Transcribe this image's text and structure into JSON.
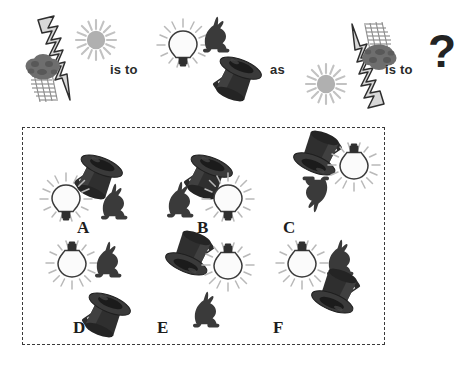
{
  "puzzle": {
    "type": "visual-analogy",
    "connectors": {
      "first": "is to",
      "second": "as",
      "third": "is to"
    },
    "unknown_marker": "?",
    "prompt_row": {
      "term_a": {
        "name": "storm-scene",
        "elements": [
          "storm-cloud-with-rain",
          "lightning-bolt",
          "sun-starburst"
        ],
        "orientation": "upright"
      },
      "term_b": {
        "name": "magic-scene",
        "elements": [
          "light-bulb",
          "rabbit",
          "top-hat-with-wand"
        ],
        "orientation": "upright"
      },
      "term_c": {
        "name": "storm-scene-rotated",
        "elements": [
          "storm-cloud-with-rain",
          "lightning-bolt",
          "sun-starburst"
        ],
        "orientation": "rotated-180"
      },
      "term_d": {
        "name": "unknown",
        "elements": [],
        "orientation": "unknown"
      }
    },
    "options": [
      {
        "label": "A",
        "bulb": "upright",
        "rabbit": "upright",
        "hat": "upright",
        "layout": "hat-top-left, bulb-lower-left, rabbit-lower-right"
      },
      {
        "label": "B",
        "bulb": "upright",
        "rabbit": "upright",
        "hat": "upright",
        "layout": "hat-top-left, rabbit-lower-left, bulb-lower-right"
      },
      {
        "label": "C",
        "bulb": "rotated-180",
        "rabbit": "rotated-180",
        "hat": "rotated-180",
        "layout": "hat-top-left, bulb-top-right, rabbit-below"
      },
      {
        "label": "D",
        "bulb": "rotated-180",
        "rabbit": "upright",
        "hat": "upright",
        "layout": "bulb-top-left, rabbit-top-right, hat-bottom"
      },
      {
        "label": "E",
        "bulb": "rotated-180",
        "rabbit": "upright",
        "hat": "rotated-180",
        "layout": "hat-top-left, bulb-top-right, rabbit-below"
      },
      {
        "label": "F",
        "bulb": "rotated-180",
        "rabbit": "upright",
        "hat": "rotated-180",
        "layout": "bulb-top-left, rabbit-top-right, hat-bottom"
      }
    ]
  },
  "colors": {
    "ink": "#232323",
    "hat_dark": "#2f2f2f",
    "hat_mid": "#4a4a4a",
    "rabbit": "#3a3a3a",
    "cloud": "#6e6e6e",
    "rain": "#8a8a8a",
    "sun": "#b4b4b4",
    "bolt_fill": "#d8d8d8",
    "bulb_glass": "#fbfbfb",
    "panel_border": "#3a3a3a"
  }
}
